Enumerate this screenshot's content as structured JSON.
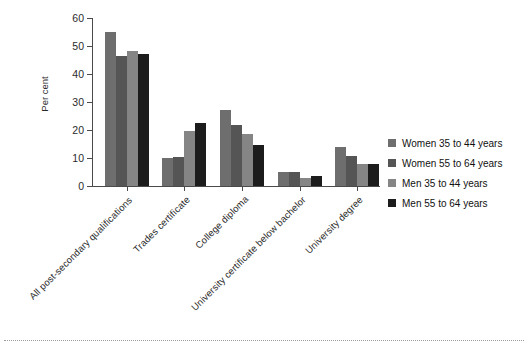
{
  "chart_data": {
    "type": "bar",
    "title": "",
    "subtitle": "",
    "xlabel": "",
    "ylabel": "Per cent",
    "ylim": [
      0,
      60
    ],
    "yticks": [
      0,
      10,
      20,
      30,
      40,
      50,
      60
    ],
    "ytick_labels": [
      "0",
      "10",
      "20",
      "30",
      "40",
      "50",
      "60"
    ],
    "grid": false,
    "legend_position": "right",
    "categories": [
      "All post-secondary qualifications",
      "Trades certificate",
      "College diploma",
      "University certificate below bachelor",
      "University degree"
    ],
    "series": [
      {
        "name": "Women 35 to 44 years",
        "color": "#6e6e6e",
        "values": [
          55.0,
          10.0,
          27.2,
          5.0,
          14.0
        ]
      },
      {
        "name": "Women 55 to 64 years",
        "color": "#555555",
        "values": [
          46.3,
          10.4,
          21.7,
          5.1,
          10.7
        ]
      },
      {
        "name": "Men 35 to 44 years",
        "color": "#858585",
        "values": [
          48.1,
          19.5,
          18.5,
          3.0,
          8.0
        ]
      },
      {
        "name": "Men 55 to 64 years",
        "color": "#1c1c1c",
        "values": [
          47.2,
          22.5,
          14.5,
          3.5,
          8.0
        ]
      }
    ]
  },
  "axis": {
    "tick_color": "#4a4a4a"
  },
  "footer": {
    "rule_color": "#9a9a9a"
  }
}
